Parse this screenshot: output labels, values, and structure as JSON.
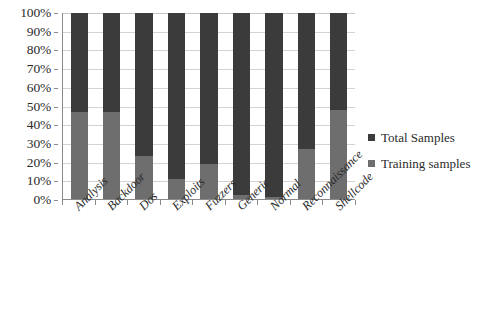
{
  "chart_data": {
    "type": "bar",
    "stacked": true,
    "normalized_percent": true,
    "title": "",
    "xlabel": "",
    "ylabel": "",
    "ylim": [
      0,
      100
    ],
    "grid": true,
    "legend_position": "right",
    "categories": [
      "Analysis",
      "Backdoor",
      "Dos",
      "Exploits",
      "Fuzzers",
      "Generic",
      "Normal",
      "Reconnaissance",
      "Shellcode"
    ],
    "y_ticks": [
      "0%",
      "10%",
      "20%",
      "30%",
      "40%",
      "50%",
      "60%",
      "70%",
      "80%",
      "90%",
      "100%"
    ],
    "y_tick_values": [
      0,
      10,
      20,
      30,
      40,
      50,
      60,
      70,
      80,
      90,
      100
    ],
    "series": [
      {
        "name": "Training samples",
        "color": "#6e6e6e",
        "values": [
          47,
          47,
          23,
          11,
          19,
          2,
          1,
          27,
          48
        ]
      },
      {
        "name": "Total Samples",
        "color": "#3b3b3b",
        "values": [
          53,
          53,
          77,
          89,
          81,
          98,
          99,
          73,
          52
        ]
      }
    ]
  },
  "legend": {
    "items": [
      {
        "label": "Total Samples",
        "color": "#3b3b3b"
      },
      {
        "label": "Training samples",
        "color": "#6e6e6e"
      }
    ]
  }
}
